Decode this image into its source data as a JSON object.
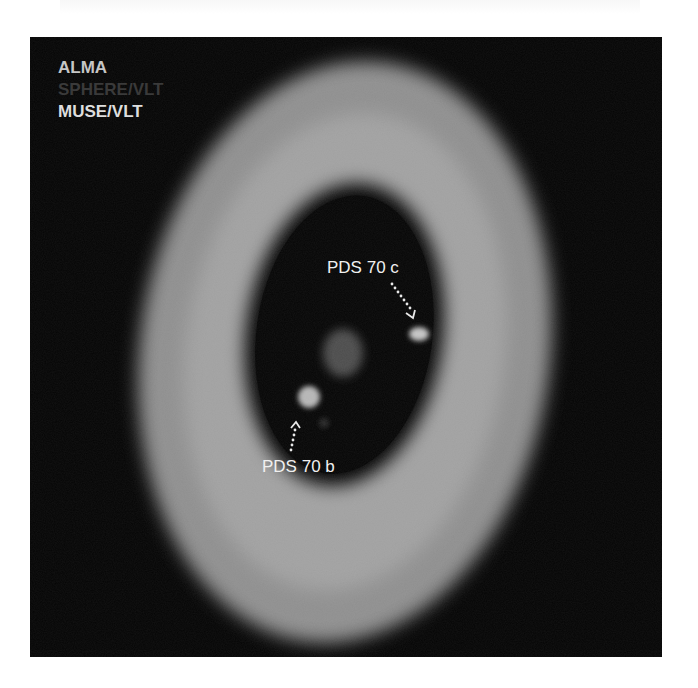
{
  "image": {
    "description": "Composite image of the PDS 70 protoplanetary disk system showing two planets in the disk gap",
    "legend": [
      {
        "label": "ALMA",
        "color": "#c6c6c6"
      },
      {
        "label": "SPHERE/VLT",
        "color": "#3a3a3a"
      },
      {
        "label": "MUSE/VLT",
        "color": "#dedede"
      }
    ],
    "annotations": [
      {
        "label": "PDS 70 c",
        "arrow": "dotted-down-right"
      },
      {
        "label": "PDS 70 b",
        "arrow": "dotted-up"
      }
    ],
    "colors": {
      "background": "#050505",
      "ring": "#9a9a9a",
      "ring_bright": "#b4b4b4",
      "cavity": "#060606",
      "star": "#555555",
      "planet": "#c8c8c8"
    }
  }
}
